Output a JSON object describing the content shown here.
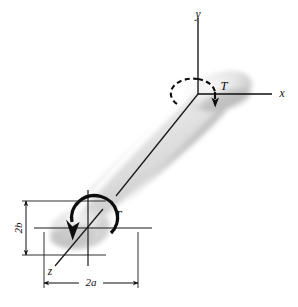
{
  "figure": {
    "type": "engineering-diagram",
    "background_color": "#ffffff",
    "line_color": "#0d0d0d",
    "shaft_fill_light": "#f2f2f2",
    "shaft_fill_mid": "#d8d8d8",
    "shaft_fill_dark": "#b8b8b8"
  },
  "axes": {
    "y_label": "y",
    "x_label": "x",
    "z_label": "z",
    "origin_upper": {
      "x": 198,
      "y": 94
    },
    "origin_lower": {
      "x": 88,
      "y": 228
    }
  },
  "torque": {
    "upper_label": "T",
    "lower_label": "T",
    "sense": "counterclockwise about shaft axis"
  },
  "dimensions": [
    {
      "name": "minor-axis-dimension",
      "label": "2b",
      "orientation": "vertical",
      "describes": "full height of elliptical cross-section"
    },
    {
      "name": "major-axis-dimension",
      "label": "2a",
      "orientation": "horizontal",
      "describes": "full width of elliptical cross-section"
    }
  ]
}
